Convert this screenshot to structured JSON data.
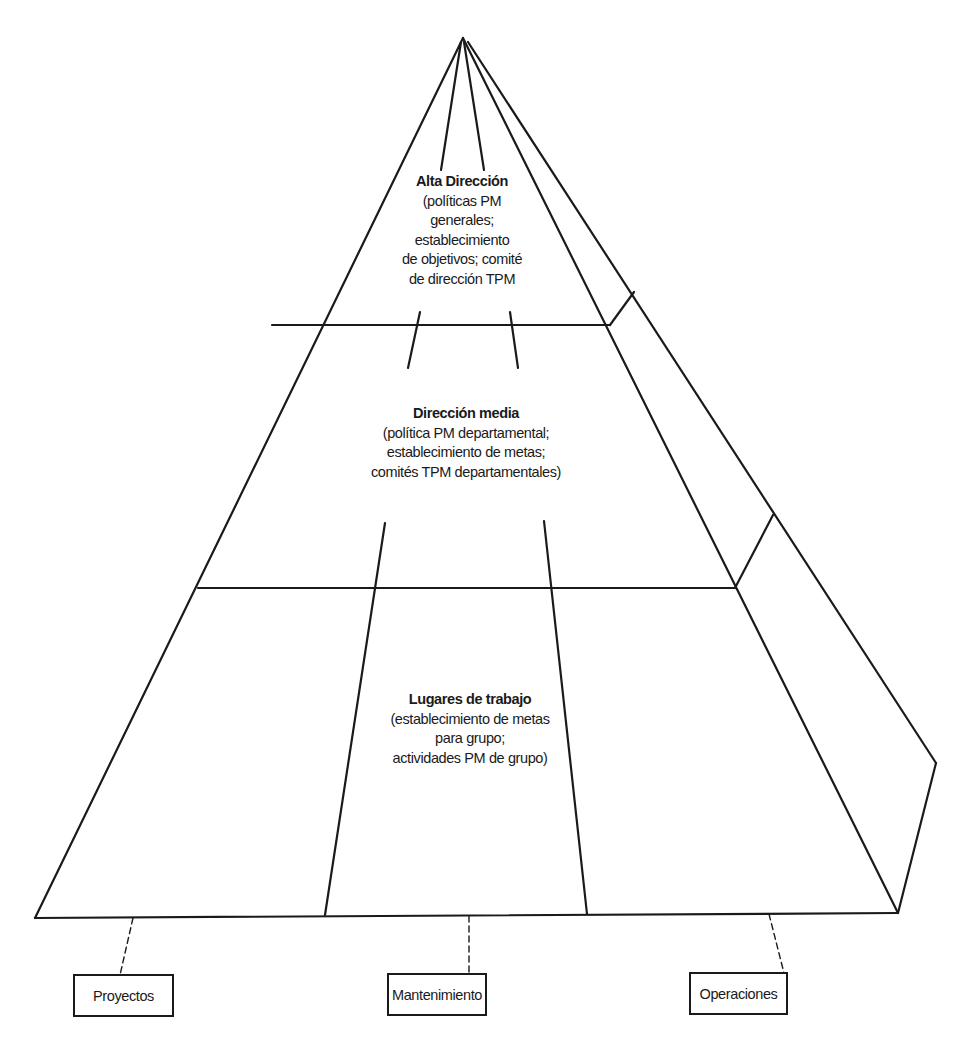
{
  "diagram": {
    "type": "pyramid",
    "tiers": [
      {
        "title": "Alta Dirección",
        "lines": [
          "(políticas PM",
          "generales;",
          "establecimiento",
          "de objetivos; comité",
          "de dirección TPM"
        ]
      },
      {
        "title": "Dirección media",
        "lines": [
          "(política PM departamental;",
          "establecimiento de metas;",
          "comités TPM departamentales)"
        ]
      },
      {
        "title": "Lugares de trabajo",
        "lines": [
          "(establecimiento de metas",
          "para grupo;",
          "actividades PM de grupo)"
        ]
      }
    ],
    "departments": [
      {
        "label": "Proyectos"
      },
      {
        "label": "Mantenimiento"
      },
      {
        "label": "Operaciones"
      }
    ],
    "colors": {
      "line": "#1a1a1a",
      "background": "#ffffff"
    }
  }
}
